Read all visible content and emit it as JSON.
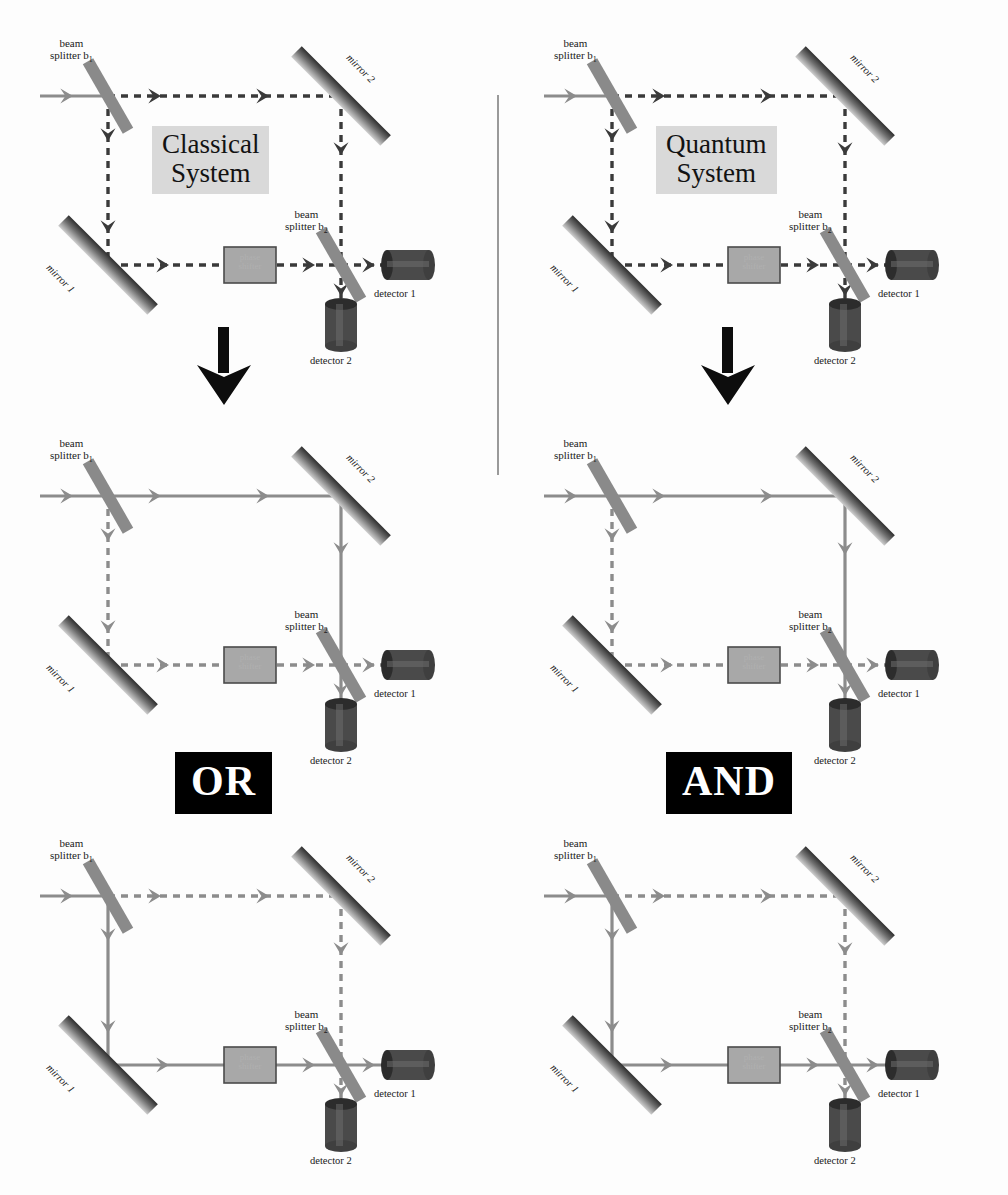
{
  "figure": {
    "title_left": "Classical System",
    "title_right": "Quantum System",
    "gate_left": "OR",
    "gate_right": "AND",
    "divider": true,
    "colors": {
      "beam_active": "#8c8c8c",
      "beam_dashed": "#3a3a3a",
      "beam_dashed_light": "#8c8c8c",
      "mirror_dark": "#2e2e2e",
      "mirror_light": "#cfcfcf",
      "splitter": "#8a8a8a",
      "detector": "#4a4a4a",
      "phase_shifter_fill": "#a8a8a8",
      "phase_shifter_border": "#4a4a4a",
      "label_box": "#d9d9d9",
      "gate_bg": "#000000",
      "gate_fg": "#ffffff",
      "arrow": "#0d0d0d",
      "divider": "#9a9a9a"
    }
  },
  "labels": {
    "beam_splitter_1_line1": "beam",
    "beam_splitter_1_line2": "splitter b",
    "beam_splitter_1_sub": "1",
    "beam_splitter_2_line1": "beam",
    "beam_splitter_2_line2": "splitter b",
    "beam_splitter_2_sub": "2",
    "mirror_1": "mirror 1",
    "mirror_2": "mirror 2",
    "detector_1": "detector 1",
    "detector_2": "detector 2",
    "phase_shifter_line1": "phase",
    "phase_shifter_line2": "shifter"
  },
  "panels": [
    {
      "id": "classical-top",
      "column": "classical",
      "row": "top",
      "system_label": "Classical System",
      "upper_path": "dashed",
      "lower_path": "dashed",
      "output_detector_1": "dashed",
      "output_detector_2": "dashed",
      "input_beam": "solid"
    },
    {
      "id": "quantum-top",
      "column": "quantum",
      "row": "top",
      "system_label": "Quantum System",
      "upper_path": "dashed",
      "lower_path": "dashed",
      "output_detector_1": "dashed",
      "output_detector_2": "dashed",
      "input_beam": "solid"
    },
    {
      "id": "classical-middle",
      "column": "classical",
      "row": "middle",
      "system_label": "",
      "upper_path": "solid",
      "lower_path": "dashed",
      "output_detector_1": "dashed",
      "output_detector_2": "solid",
      "input_beam": "solid"
    },
    {
      "id": "quantum-middle",
      "column": "quantum",
      "row": "middle",
      "system_label": "",
      "upper_path": "solid",
      "lower_path": "dashed",
      "output_detector_1": "dashed",
      "output_detector_2": "solid",
      "input_beam": "solid"
    },
    {
      "id": "classical-bottom",
      "column": "classical",
      "row": "bottom",
      "system_label": "",
      "upper_path": "dashed",
      "lower_path": "solid",
      "output_detector_1": "solid",
      "output_detector_2": "dashed",
      "input_beam": "solid"
    },
    {
      "id": "quantum-bottom",
      "column": "quantum",
      "row": "bottom",
      "system_label": "",
      "upper_path": "dashed",
      "lower_path": "solid",
      "output_detector_1": "solid",
      "output_detector_2": "dashed",
      "input_beam": "solid"
    }
  ],
  "arrows": {
    "left_flow": "down-arrow",
    "right_flow": "down-arrow"
  }
}
